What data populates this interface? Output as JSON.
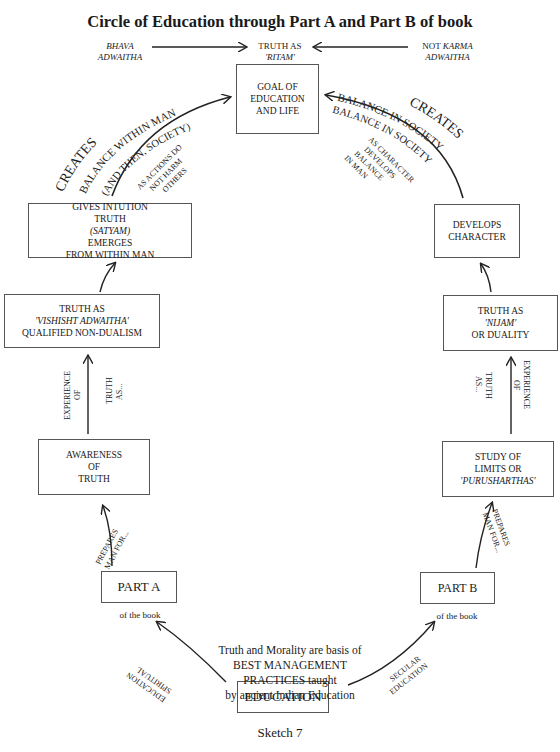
{
  "title": "Circle of Education through Part A and Part B of book",
  "top": {
    "left_label": [
      "BHAVA",
      "ADWAITHA"
    ],
    "center_label": [
      "TRUTH AS",
      "'RITAM'"
    ],
    "right_label_prefix": "NOT ",
    "right_label_italic": "KARMA",
    "right_label_line2": "ADWAITHA"
  },
  "nodes": {
    "goal": [
      "GOAL OF",
      "EDUCATION",
      "AND LIFE"
    ],
    "gives_intuition": {
      "line1": "GIVES INTUTION",
      "line2_prefix": "TRUTH ",
      "line2_italic": "(SATYAM)",
      "line2_suffix": " EMERGES",
      "line3": "FROM WITHIN MAN"
    },
    "vishisht": {
      "line1": "TRUTH AS",
      "line2_italic": "'VISHISHT ADWAITHA'",
      "line3": "QUALIFIED NON-DUALISM"
    },
    "awareness": [
      "AWARENESS",
      "OF",
      "TRUTH"
    ],
    "part_a": "PART A",
    "part_a_sub": "of the book",
    "develops_character": [
      "DEVELOPS",
      "CHARACTER"
    ],
    "nijam": {
      "line1_prefix": "TRUTH AS ",
      "line1_italic": "'NIJAM'",
      "line2": "OR DUALITY"
    },
    "study_limits": {
      "line1": "STUDY OF",
      "line2": "LIMITS OR",
      "line3_italic": "'PURUSHARTHAS'"
    },
    "part_b": "PART B",
    "part_b_sub": "of the book",
    "education": "EDUCATION"
  },
  "edge_labels": {
    "left_arc_outer": "CREATES",
    "left_arc_inner": "BALANCE WITHIN MAN",
    "left_arc_inner2": "(AND THEN, SOCIETY)",
    "left_arc_note": [
      "AS ACTIONS DO",
      "NOT HARM",
      "OTHERS"
    ],
    "right_arc_outer": "CREATES",
    "right_arc_inner": "BALANCE IN SOCIETY",
    "right_arc_inner2": "BALANCE IN SOCIETY",
    "right_arc_note": [
      "AS CHARACTER",
      "DEVELOPS",
      "BALANCE",
      "IN MAN"
    ],
    "left_experience": [
      "EXPERIENCE",
      "OF"
    ],
    "left_truth_as": [
      "TRUTH",
      "AS..."
    ],
    "right_experience": [
      "EXPERIENCE",
      "OF"
    ],
    "right_truth_as": [
      "TRUTH",
      "AS..."
    ],
    "left_prepares": [
      "PREPARES",
      "MAN FOR..."
    ],
    "right_prepares": [
      "PREPARES",
      "MAN FOR..."
    ],
    "spiritual": [
      "SPIRITUAL",
      "EDUCATION"
    ],
    "secular": [
      "SECULAR",
      "EDUCATION"
    ]
  },
  "center_text": [
    "Truth and Morality are basis of",
    "BEST MANAGEMENT",
    "PRACTICES taught",
    "by ancient Indian Education"
  ],
  "caption": "Sketch 7"
}
